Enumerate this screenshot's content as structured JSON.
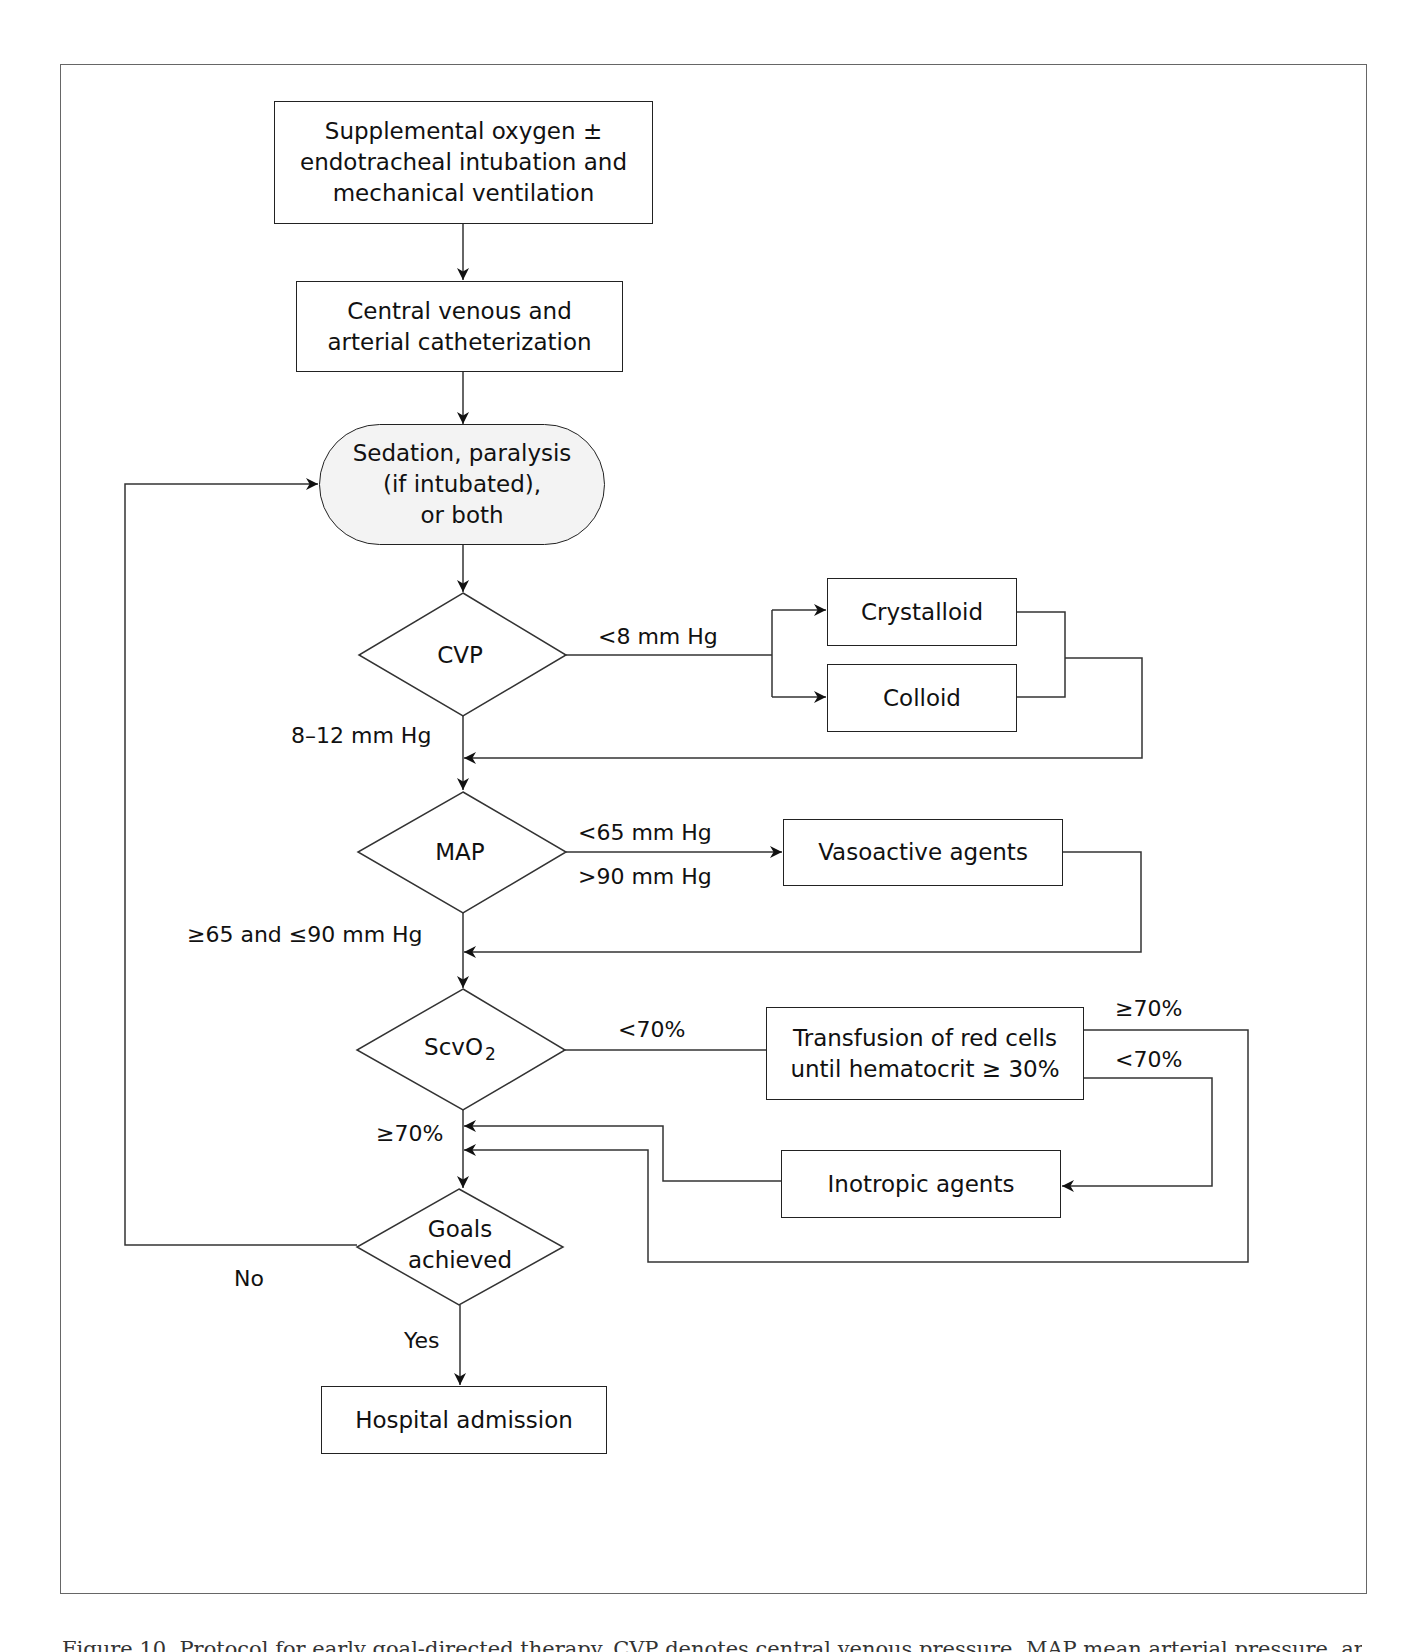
{
  "nodes": {
    "supplemental_oxygen": {
      "lines": [
        "Supplemental oxygen ±",
        "endotracheal intubation and",
        "mechanical ventilation"
      ]
    },
    "catheterization": {
      "lines": [
        "Central venous and",
        "arterial catheterization"
      ]
    },
    "sedation": {
      "lines": [
        "Sedation, paralysis",
        "(if intubated),",
        "or both"
      ]
    },
    "cvp": {
      "label": "CVP"
    },
    "crystalloid": {
      "label": "Crystalloid"
    },
    "colloid": {
      "label": "Colloid"
    },
    "map": {
      "label": "MAP"
    },
    "vasoactive": {
      "label": "Vasoactive agents"
    },
    "scvo2": {
      "label": "ScvO",
      "subscript": "2"
    },
    "transfusion": {
      "lines": [
        "Transfusion of red cells",
        "until hematocrit ≥ 30%"
      ]
    },
    "inotropic": {
      "label": "Inotropic agents"
    },
    "goals": {
      "lines": [
        "Goals",
        "achieved"
      ]
    },
    "hospital": {
      "label": "Hospital admission"
    }
  },
  "edge_labels": {
    "cvp_low": "<8 mm Hg",
    "cvp_ok": "8–12 mm Hg",
    "map_low": "<65 mm Hg",
    "map_high": ">90 mm Hg",
    "map_ok": "≥65 and ≤90 mm Hg",
    "scvo2_low": "<70%",
    "scvo2_ok": "≥70%",
    "transfusion_ok": "≥70%",
    "transfusion_low": "<70%",
    "goals_no": "No",
    "goals_yes": "Yes"
  },
  "caption": "Figure 10. Protocol for early goal-directed therapy. CVP denotes central venous pressure, MAP mean arterial pressure, and ScvO2 central venous oxygen saturation."
}
